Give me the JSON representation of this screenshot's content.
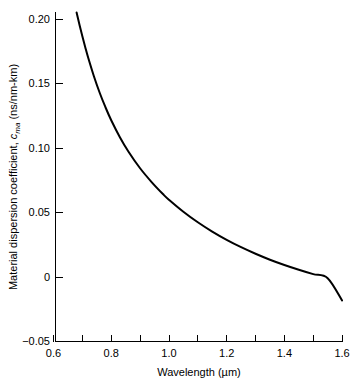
{
  "chart_data": {
    "type": "line",
    "title": "",
    "subtitle": "",
    "xlabel": "Wavelength (µm)",
    "ylabel_prefix": "Material dispersion coefficient, ",
    "ylabel_symbol": "c",
    "ylabel_subscript": "ma",
    "ylabel_units": " (ns/nm-km)",
    "ylabel_full": "Material dispersion coefficient, c_ma (ns/nm-km)",
    "xlim": [
      0.6,
      1.6
    ],
    "ylim": [
      -0.05,
      0.2054
    ],
    "x_major_ticks": [
      0.6,
      0.8,
      1.0,
      1.2,
      1.4,
      1.6
    ],
    "x_major_tick_labels": [
      "0.6",
      "0.8",
      "1.0",
      "1.2",
      "1.4",
      "1.6"
    ],
    "x_minor_ticks": [
      0.7,
      0.9,
      1.1,
      1.3,
      1.5
    ],
    "y_major_ticks": [
      -0.05,
      0,
      0.05,
      0.1,
      0.15,
      0.2
    ],
    "y_major_tick_labels": [
      "−0.05",
      "0",
      "0.05",
      "0.10",
      "0.15",
      "0.20"
    ],
    "grid": false,
    "legend": null,
    "legend_position": "none",
    "series": [
      {
        "name": "Material dispersion coefficient",
        "color": "#000000",
        "x": [
          0.68,
          0.69,
          0.7,
          0.71,
          0.72,
          0.74,
          0.76,
          0.78,
          0.8,
          0.83,
          0.86,
          0.9,
          0.94,
          0.98,
          1.0,
          1.05,
          1.1,
          1.15,
          1.2,
          1.25,
          1.3,
          1.35,
          1.4,
          1.45,
          1.5,
          1.55,
          1.6
        ],
        "y": [
          0.2054,
          0.196,
          0.187,
          0.1785,
          0.1705,
          0.156,
          0.1432,
          0.132,
          0.1219,
          0.1088,
          0.0975,
          0.0847,
          0.074,
          0.0645,
          0.0603,
          0.051,
          0.0428,
          0.0356,
          0.0292,
          0.0235,
          0.0184,
          0.0138,
          0.0097,
          0.006,
          0.0026,
          -0.0005,
          -0.0178
        ]
      }
    ],
    "axis_style": {
      "spines": [
        "left",
        "bottom"
      ],
      "tick_direction": "in",
      "line_color": "#000000"
    }
  }
}
